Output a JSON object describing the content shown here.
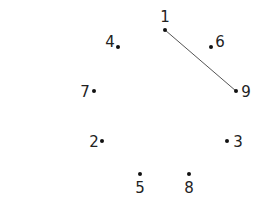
{
  "puzzle": {
    "type": "connect-the-dots",
    "dots": [
      {
        "n": "1",
        "x": 165,
        "y": 30,
        "lx": 165,
        "ly": 22,
        "anchor": "middle"
      },
      {
        "n": "2",
        "x": 102,
        "y": 141,
        "lx": 94,
        "ly": 147,
        "anchor": "middle"
      },
      {
        "n": "3",
        "x": 227,
        "y": 141,
        "lx": 238,
        "ly": 147,
        "anchor": "middle"
      },
      {
        "n": "4",
        "x": 118,
        "y": 47,
        "lx": 110,
        "ly": 47,
        "anchor": "middle"
      },
      {
        "n": "5",
        "x": 140,
        "y": 174,
        "lx": 140,
        "ly": 193,
        "anchor": "middle"
      },
      {
        "n": "6",
        "x": 211,
        "y": 47,
        "lx": 220,
        "ly": 47,
        "anchor": "middle"
      },
      {
        "n": "7",
        "x": 94,
        "y": 91,
        "lx": 85,
        "ly": 97,
        "anchor": "middle"
      },
      {
        "n": "8",
        "x": 189,
        "y": 174,
        "lx": 189,
        "ly": 193,
        "anchor": "middle"
      },
      {
        "n": "9",
        "x": 236,
        "y": 91,
        "lx": 246,
        "ly": 97,
        "anchor": "middle"
      }
    ],
    "lines": [
      {
        "from": "1",
        "to": "9"
      }
    ],
    "colors": {
      "dot": "#111111",
      "line": "#555555",
      "text": "#222222"
    }
  }
}
